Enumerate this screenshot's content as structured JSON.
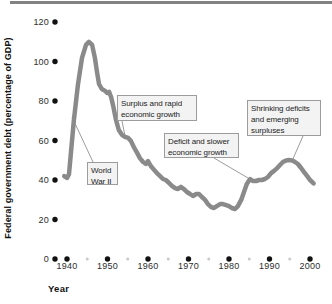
{
  "figure": {
    "top_rule_color": "#828282",
    "background": "#ffffff"
  },
  "chart_data": {
    "type": "line",
    "title": "",
    "xlabel": "Year",
    "ylabel": "Federal government debt (percentage of GDP)",
    "xlim": [
      1937,
      2002
    ],
    "ylim": [
      0,
      120
    ],
    "grid": false,
    "x_ticks": [
      1940,
      1950,
      1960,
      1970,
      1980,
      1990,
      2000
    ],
    "x_minor_ticks": [
      1945,
      1955,
      1965,
      1975,
      1985,
      1995
    ],
    "y_ticks": [
      0,
      20,
      40,
      60,
      80,
      100,
      120
    ],
    "line_color": "#8a8a8a",
    "tick_dot_color": "#111111",
    "minor_dot_color": "#c9c9c9",
    "leader_color": "#9c9c9c",
    "series": [
      {
        "points": [
          [
            1939.3,
            42.0
          ],
          [
            1940.0,
            41.0
          ],
          [
            1940.5,
            43.0
          ],
          [
            1941.0,
            54.2
          ],
          [
            1941.7,
            70.4
          ],
          [
            1942.7,
            88.1
          ],
          [
            1943.7,
            101.8
          ],
          [
            1944.7,
            108.4
          ],
          [
            1945.4,
            109.9
          ],
          [
            1946.2,
            108.4
          ],
          [
            1946.9,
            101.8
          ],
          [
            1947.4,
            94.7
          ],
          [
            1947.9,
            88.6
          ],
          [
            1948.6,
            86.1
          ],
          [
            1949.4,
            85.1
          ],
          [
            1949.9,
            84.1
          ],
          [
            1950.4,
            84.6
          ],
          [
            1950.9,
            82.0
          ],
          [
            1951.4,
            77.5
          ],
          [
            1952.1,
            70.4
          ],
          [
            1952.8,
            65.3
          ],
          [
            1953.6,
            62.8
          ],
          [
            1954.3,
            61.8
          ],
          [
            1955.1,
            61.3
          ],
          [
            1955.8,
            59.7
          ],
          [
            1956.5,
            56.7
          ],
          [
            1957.3,
            53.7
          ],
          [
            1958.0,
            51.1
          ],
          [
            1958.8,
            49.1
          ],
          [
            1959.5,
            48.1
          ],
          [
            1960.0,
            49.6
          ],
          [
            1960.7,
            47.1
          ],
          [
            1961.5,
            45.1
          ],
          [
            1962.2,
            43.5
          ],
          [
            1963.0,
            42.0
          ],
          [
            1963.7,
            40.5
          ],
          [
            1964.4,
            40.0
          ],
          [
            1965.2,
            38.5
          ],
          [
            1965.9,
            37.0
          ],
          [
            1966.7,
            35.9
          ],
          [
            1967.4,
            35.4
          ],
          [
            1968.1,
            36.5
          ],
          [
            1968.9,
            35.4
          ],
          [
            1969.6,
            33.9
          ],
          [
            1970.4,
            32.9
          ],
          [
            1971.1,
            31.9
          ],
          [
            1971.9,
            32.9
          ],
          [
            1972.6,
            32.9
          ],
          [
            1973.3,
            31.4
          ],
          [
            1974.1,
            29.9
          ],
          [
            1974.8,
            27.8
          ],
          [
            1975.6,
            26.3
          ],
          [
            1976.3,
            25.8
          ],
          [
            1977.0,
            26.8
          ],
          [
            1977.8,
            27.8
          ],
          [
            1978.5,
            27.8
          ],
          [
            1979.3,
            27.3
          ],
          [
            1980.0,
            26.8
          ],
          [
            1980.7,
            25.8
          ],
          [
            1981.5,
            25.3
          ],
          [
            1982.2,
            26.8
          ],
          [
            1983.0,
            29.9
          ],
          [
            1983.7,
            33.9
          ],
          [
            1984.4,
            38.0
          ],
          [
            1985.2,
            40.5
          ],
          [
            1985.9,
            39.5
          ],
          [
            1986.7,
            39.5
          ],
          [
            1987.4,
            40.0
          ],
          [
            1988.1,
            40.0
          ],
          [
            1988.9,
            40.5
          ],
          [
            1989.6,
            41.5
          ],
          [
            1990.4,
            43.5
          ],
          [
            1991.1,
            44.6
          ],
          [
            1991.9,
            46.0
          ],
          [
            1992.6,
            47.6
          ],
          [
            1993.3,
            49.1
          ],
          [
            1994.1,
            49.9
          ],
          [
            1994.8,
            50.1
          ],
          [
            1995.6,
            49.9
          ],
          [
            1996.3,
            49.1
          ],
          [
            1997.0,
            48.1
          ],
          [
            1997.8,
            46.1
          ],
          [
            1998.5,
            44.1
          ],
          [
            1999.3,
            42.0
          ],
          [
            2000.0,
            40.0
          ],
          [
            2000.9,
            38.3
          ]
        ]
      }
    ],
    "annotations": [
      {
        "id": "world-war-ii",
        "lines": [
          "World",
          "War II"
        ],
        "box_px": {
          "x": 87,
          "y": 162,
          "w": 31,
          "h": 23
        },
        "leader_px": {
          "x1": 93,
          "y1": 162,
          "x2": 72,
          "y2": 117
        }
      },
      {
        "id": "surplus-rapid-growth",
        "lines": [
          "Surplus and rapid",
          "economic growth"
        ],
        "box_px": {
          "x": 117,
          "y": 95,
          "w": 80,
          "h": 26
        },
        "leader_px": {
          "x1": 122,
          "y1": 121,
          "x2": 125,
          "y2": 136
        }
      },
      {
        "id": "deficit-slower-growth",
        "lines": [
          "Deficit and slower",
          "economic growth"
        ],
        "box_px": {
          "x": 164,
          "y": 133,
          "w": 75,
          "h": 25
        },
        "leader_px": {
          "x1": 214,
          "y1": 158,
          "x2": 248,
          "y2": 178
        }
      },
      {
        "id": "shrinking-deficits",
        "lines": [
          "Shrinking deficits",
          "and emerging",
          "surpluses"
        ],
        "box_px": {
          "x": 247,
          "y": 100,
          "w": 74,
          "h": 36
        },
        "leader_px": {
          "x1": 303,
          "y1": 136,
          "x2": 292,
          "y2": 161
        }
      }
    ]
  },
  "layout": {
    "x0_year": 1940,
    "x0_px": 67,
    "px_per_year": 4.05,
    "y0_px": 259,
    "px_per_unit": 1.975,
    "y_dot_x": 55,
    "major_dot_r": 2.7,
    "minor_dot_r": 1.5,
    "line_width": 4.5
  }
}
